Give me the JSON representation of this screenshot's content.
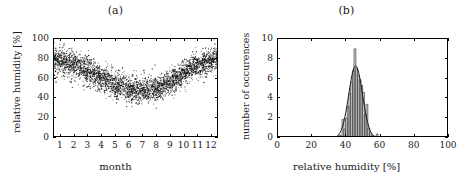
{
  "figure": {
    "panels": [
      {
        "title": "(a)",
        "xlabel": "month",
        "ylabel": "relative humidity [%]"
      },
      {
        "title": "(b)",
        "xlabel": "relative humidity [%]",
        "ylabel": "number of occurences"
      }
    ]
  },
  "chart_data": [
    {
      "type": "scatter",
      "title": "(a)",
      "xlabel": "month",
      "ylabel": "relative humidity [%]",
      "xlim": [
        0.5,
        12.5
      ],
      "ylim": [
        0,
        100
      ],
      "xticks": [
        1,
        2,
        3,
        4,
        5,
        6,
        7,
        8,
        9,
        10,
        11,
        12
      ],
      "xtick_labels": [
        "1",
        "2",
        "3",
        "4",
        "5",
        "6",
        "7",
        "8",
        "9",
        "10",
        "11",
        "12"
      ],
      "yticks": [
        0,
        20,
        40,
        60,
        80,
        100
      ],
      "ytick_labels": [
        "0",
        "20",
        "40",
        "60",
        "80",
        "100"
      ],
      "grid": false,
      "legend": "none",
      "marker_color": "#111111",
      "description": "Dense cloud of daily relative humidity values per month; seasonal U-shape with winter maxima and summer minimum.",
      "monthly_mean": [
        78,
        74,
        68,
        60,
        53,
        49,
        48,
        50,
        57,
        66,
        74,
        78
      ],
      "monthly_spread": [
        11,
        11,
        11,
        11,
        11,
        11,
        10,
        10,
        10,
        10,
        10,
        11
      ],
      "points_per_month": 290,
      "seed": 20240517
    },
    {
      "type": "bar",
      "title": "(b)",
      "xlabel": "relative humidity [%]",
      "ylabel": "number of occurences",
      "xlim": [
        0,
        100
      ],
      "ylim": [
        0,
        10
      ],
      "xticks": [
        0,
        20,
        40,
        60,
        80,
        100
      ],
      "xtick_labels": [
        "0",
        "20",
        "40",
        "60",
        "80",
        "100"
      ],
      "yticks": [
        0,
        2,
        4,
        6,
        8,
        10
      ],
      "ytick_labels": [
        "0",
        "2",
        "4",
        "6",
        "8",
        "10"
      ],
      "grid": false,
      "legend": "none",
      "bar_color": "#555555",
      "curve_color": "#1a1a1a",
      "bin_width": 1,
      "bin_centers": [
        36,
        37,
        38,
        39,
        40,
        41,
        42,
        43,
        44,
        45,
        46,
        47,
        48,
        49,
        50,
        51,
        52,
        53,
        54,
        55,
        56,
        57,
        58
      ],
      "values": [
        0.3,
        0.2,
        1.9,
        0.9,
        2.0,
        3.2,
        4.5,
        5.6,
        6.8,
        9.0,
        7.0,
        6.3,
        5.9,
        5.3,
        4.6,
        2.4,
        3.4,
        1.0,
        0.5,
        0.3,
        0.2,
        0.1,
        0.4
      ],
      "fit": {
        "type": "gaussian",
        "amplitude": 7.3,
        "mean": 45.4,
        "sigma": 4.0
      }
    }
  ]
}
